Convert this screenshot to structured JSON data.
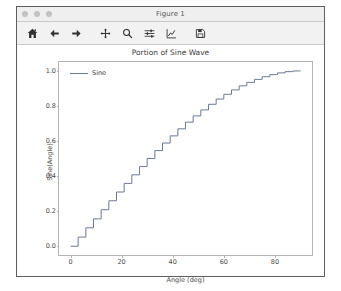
{
  "window": {
    "title": "Figure 1",
    "traffic_lights": [
      "close-dot",
      "minimize-dot",
      "zoom-dot"
    ]
  },
  "toolbar": {
    "buttons": [
      {
        "name": "home-icon",
        "label": "Home"
      },
      {
        "name": "back-arrow-icon",
        "label": "Back"
      },
      {
        "name": "forward-arrow-icon",
        "label": "Forward"
      },
      {
        "name": "pan-move-icon",
        "label": "Pan"
      },
      {
        "name": "zoom-magnifier-icon",
        "label": "Zoom to rectangle"
      },
      {
        "name": "configure-subplots-sliders-icon",
        "label": "Configure subplots"
      },
      {
        "name": "edit-axis-curve-icon",
        "label": "Edit axis, curve and image parameters"
      },
      {
        "name": "save-floppy-icon",
        "label": "Save the figure"
      }
    ]
  },
  "chart_data": {
    "type": "line",
    "title": "Portion of Sine Wave",
    "xlabel": "Angle (deg)",
    "ylabel": "Sine(Angle)",
    "xlim": [
      -4.5,
      94.5
    ],
    "ylim": [
      -0.05,
      1.05
    ],
    "xticks": [
      0,
      20,
      40,
      60,
      80
    ],
    "yticks": [
      0.0,
      0.2,
      0.4,
      0.6,
      0.8,
      1.0
    ],
    "ytick_labels": [
      "0.0",
      "0.2",
      "0.4",
      "0.6",
      "0.8",
      "1.0"
    ],
    "xtick_labels": [
      "0",
      "20",
      "40",
      "60",
      "80"
    ],
    "grid": false,
    "drawstyle": "steps-post",
    "legend": {
      "position": "upper left",
      "entries": [
        "Sine"
      ]
    },
    "line_color": "#6b7a99",
    "series": [
      {
        "name": "Sine",
        "x": [
          0,
          3,
          6,
          9,
          12,
          15,
          18,
          21,
          24,
          27,
          30,
          33,
          36,
          39,
          42,
          45,
          48,
          51,
          54,
          57,
          60,
          63,
          66,
          69,
          72,
          75,
          78,
          81,
          84,
          87,
          90
        ],
        "values": [
          0.0,
          0.052,
          0.105,
          0.156,
          0.208,
          0.259,
          0.309,
          0.358,
          0.407,
          0.454,
          0.5,
          0.545,
          0.588,
          0.629,
          0.669,
          0.707,
          0.743,
          0.777,
          0.809,
          0.839,
          0.866,
          0.891,
          0.914,
          0.934,
          0.951,
          0.966,
          0.978,
          0.988,
          0.995,
          0.999,
          1.0
        ]
      }
    ]
  }
}
